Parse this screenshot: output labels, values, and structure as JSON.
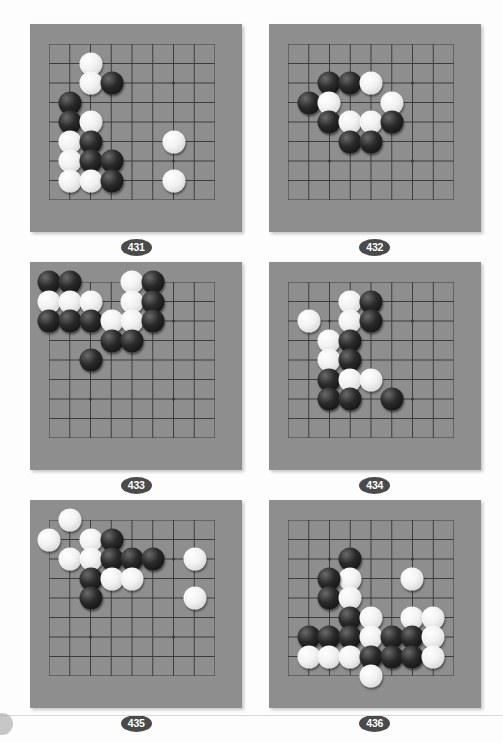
{
  "page": {
    "board_color": "#8e8e8e",
    "line_color": "#3d3d3d",
    "badge_color": "#4a4a4a",
    "black_stone_color": "#111111",
    "white_stone_color": "#f4f4f4",
    "background": "#fdfdfd",
    "columns": 8,
    "rows": 8
  },
  "problems": [
    {
      "id": "problem-431",
      "label": "431",
      "grid": {
        "cols": 8,
        "rows": 8
      },
      "stones": [
        {
          "color": "white",
          "col": 2,
          "row": 1
        },
        {
          "color": "white",
          "col": 2,
          "row": 2
        },
        {
          "color": "black",
          "col": 3,
          "row": 2
        },
        {
          "color": "black",
          "col": 1,
          "row": 3
        },
        {
          "color": "black",
          "col": 1,
          "row": 4
        },
        {
          "color": "white",
          "col": 2,
          "row": 4
        },
        {
          "color": "white",
          "col": 1,
          "row": 5
        },
        {
          "color": "black",
          "col": 2,
          "row": 5
        },
        {
          "color": "white",
          "col": 1,
          "row": 6
        },
        {
          "color": "black",
          "col": 2,
          "row": 6
        },
        {
          "color": "black",
          "col": 3,
          "row": 6
        },
        {
          "color": "white",
          "col": 1,
          "row": 7
        },
        {
          "color": "white",
          "col": 2,
          "row": 7
        },
        {
          "color": "black",
          "col": 3,
          "row": 7
        },
        {
          "color": "white",
          "col": 6,
          "row": 5
        },
        {
          "color": "white",
          "col": 6,
          "row": 7
        }
      ]
    },
    {
      "id": "problem-432",
      "label": "432",
      "grid": {
        "cols": 8,
        "rows": 8
      },
      "stones": [
        {
          "color": "black",
          "col": 2,
          "row": 2
        },
        {
          "color": "black",
          "col": 3,
          "row": 2
        },
        {
          "color": "white",
          "col": 4,
          "row": 2
        },
        {
          "color": "black",
          "col": 1,
          "row": 3
        },
        {
          "color": "white",
          "col": 2,
          "row": 3
        },
        {
          "color": "white",
          "col": 5,
          "row": 3
        },
        {
          "color": "black",
          "col": 2,
          "row": 4
        },
        {
          "color": "white",
          "col": 3,
          "row": 4
        },
        {
          "color": "white",
          "col": 4,
          "row": 4
        },
        {
          "color": "black",
          "col": 5,
          "row": 4
        },
        {
          "color": "black",
          "col": 3,
          "row": 5
        },
        {
          "color": "black",
          "col": 4,
          "row": 5
        }
      ]
    },
    {
      "id": "problem-433",
      "label": "433",
      "grid": {
        "cols": 8,
        "rows": 8
      },
      "stones": [
        {
          "color": "black",
          "col": 0,
          "row": 0
        },
        {
          "color": "black",
          "col": 1,
          "row": 0
        },
        {
          "color": "white",
          "col": 4,
          "row": 0
        },
        {
          "color": "black",
          "col": 5,
          "row": 0
        },
        {
          "color": "white",
          "col": 0,
          "row": 1
        },
        {
          "color": "white",
          "col": 1,
          "row": 1
        },
        {
          "color": "white",
          "col": 2,
          "row": 1
        },
        {
          "color": "white",
          "col": 4,
          "row": 1
        },
        {
          "color": "black",
          "col": 5,
          "row": 1
        },
        {
          "color": "black",
          "col": 0,
          "row": 2
        },
        {
          "color": "black",
          "col": 1,
          "row": 2
        },
        {
          "color": "black",
          "col": 2,
          "row": 2
        },
        {
          "color": "white",
          "col": 3,
          "row": 2
        },
        {
          "color": "white",
          "col": 4,
          "row": 2
        },
        {
          "color": "black",
          "col": 5,
          "row": 2
        },
        {
          "color": "black",
          "col": 3,
          "row": 3
        },
        {
          "color": "black",
          "col": 4,
          "row": 3
        },
        {
          "color": "black",
          "col": 2,
          "row": 4
        }
      ]
    },
    {
      "id": "problem-434",
      "label": "434",
      "grid": {
        "cols": 8,
        "rows": 8
      },
      "stones": [
        {
          "color": "white",
          "col": 3,
          "row": 1
        },
        {
          "color": "black",
          "col": 4,
          "row": 1
        },
        {
          "color": "white",
          "col": 1,
          "row": 2
        },
        {
          "color": "white",
          "col": 3,
          "row": 2
        },
        {
          "color": "black",
          "col": 4,
          "row": 2
        },
        {
          "color": "white",
          "col": 2,
          "row": 3
        },
        {
          "color": "black",
          "col": 3,
          "row": 3
        },
        {
          "color": "white",
          "col": 2,
          "row": 4
        },
        {
          "color": "black",
          "col": 3,
          "row": 4
        },
        {
          "color": "black",
          "col": 2,
          "row": 5
        },
        {
          "color": "white",
          "col": 3,
          "row": 5
        },
        {
          "color": "white",
          "col": 4,
          "row": 5
        },
        {
          "color": "black",
          "col": 2,
          "row": 6
        },
        {
          "color": "black",
          "col": 3,
          "row": 6
        },
        {
          "color": "black",
          "col": 5,
          "row": 6
        }
      ]
    },
    {
      "id": "problem-435",
      "label": "435",
      "grid": {
        "cols": 8,
        "rows": 8
      },
      "stones": [
        {
          "color": "white",
          "col": 1,
          "row": 0
        },
        {
          "color": "white",
          "col": 0,
          "row": 1
        },
        {
          "color": "white",
          "col": 2,
          "row": 1
        },
        {
          "color": "black",
          "col": 3,
          "row": 1
        },
        {
          "color": "white",
          "col": 1,
          "row": 2
        },
        {
          "color": "white",
          "col": 2,
          "row": 2
        },
        {
          "color": "black",
          "col": 3,
          "row": 2
        },
        {
          "color": "black",
          "col": 4,
          "row": 2
        },
        {
          "color": "black",
          "col": 5,
          "row": 2
        },
        {
          "color": "white",
          "col": 7,
          "row": 2
        },
        {
          "color": "black",
          "col": 2,
          "row": 3
        },
        {
          "color": "white",
          "col": 3,
          "row": 3
        },
        {
          "color": "white",
          "col": 4,
          "row": 3
        },
        {
          "color": "black",
          "col": 2,
          "row": 4
        },
        {
          "color": "white",
          "col": 7,
          "row": 4
        }
      ]
    },
    {
      "id": "problem-436",
      "label": "436",
      "grid": {
        "cols": 8,
        "rows": 8
      },
      "stones": [
        {
          "color": "black",
          "col": 3,
          "row": 2
        },
        {
          "color": "white",
          "col": 3,
          "row": 3
        },
        {
          "color": "white",
          "col": 6,
          "row": 3
        },
        {
          "color": "black",
          "col": 2,
          "row": 3
        },
        {
          "color": "black",
          "col": 2,
          "row": 4
        },
        {
          "color": "white",
          "col": 3,
          "row": 4
        },
        {
          "color": "black",
          "col": 3,
          "row": 5
        },
        {
          "color": "white",
          "col": 4,
          "row": 5
        },
        {
          "color": "white",
          "col": 6,
          "row": 5
        },
        {
          "color": "white",
          "col": 7,
          "row": 5
        },
        {
          "color": "black",
          "col": 1,
          "row": 6
        },
        {
          "color": "black",
          "col": 2,
          "row": 6
        },
        {
          "color": "black",
          "col": 3,
          "row": 6
        },
        {
          "color": "white",
          "col": 4,
          "row": 6
        },
        {
          "color": "black",
          "col": 5,
          "row": 6
        },
        {
          "color": "black",
          "col": 6,
          "row": 6
        },
        {
          "color": "white",
          "col": 7,
          "row": 6
        },
        {
          "color": "white",
          "col": 1,
          "row": 7
        },
        {
          "color": "white",
          "col": 2,
          "row": 7
        },
        {
          "color": "white",
          "col": 3,
          "row": 7
        },
        {
          "color": "black",
          "col": 4,
          "row": 7
        },
        {
          "color": "black",
          "col": 5,
          "row": 7
        },
        {
          "color": "black",
          "col": 6,
          "row": 7
        },
        {
          "color": "white",
          "col": 7,
          "row": 7
        },
        {
          "color": "white",
          "col": 4,
          "row": 8
        }
      ]
    }
  ]
}
